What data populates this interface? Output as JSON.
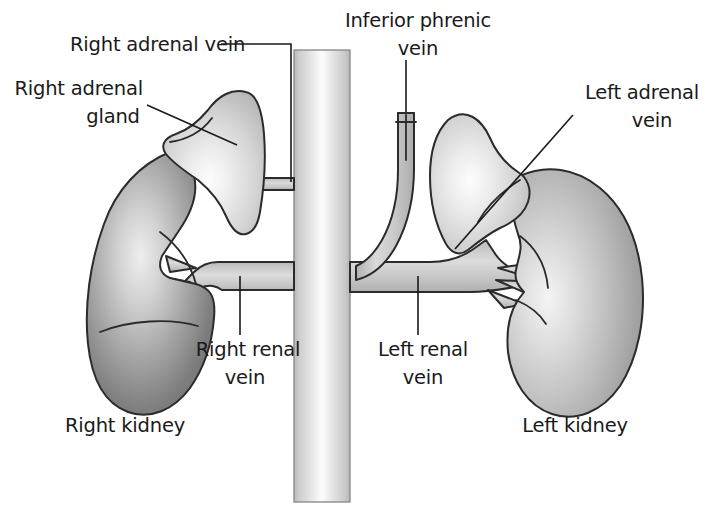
{
  "figure": {
    "background_color": "#ffffff",
    "outline_color": "#2b2b2b",
    "text_color": "#1a1a1a",
    "width": 715,
    "height": 528
  },
  "labels": {
    "right_adrenal_vein": "Right adrenal vein",
    "right_adrenal_gland_line1": "Right adrenal",
    "right_adrenal_gland_line2": "gland",
    "inferior_phrenic_vein_line1": "Inferior phrenic",
    "inferior_phrenic_vein_line2": "vein",
    "left_adrenal_vein_line1": "Left adrenal",
    "left_adrenal_vein_line2": "vein",
    "right_renal_vein_line1": "Right renal",
    "right_renal_vein_line2": "vein",
    "left_renal_vein_line1": "Left renal",
    "left_renal_vein_line2": "vein",
    "right_kidney": "Right kidney",
    "left_kidney": "Left kidney"
  },
  "structures": [
    {
      "name": "inferior-vena-cava",
      "kind": "vessel",
      "shading": "vertical-cylinder-gradient"
    },
    {
      "name": "right-kidney",
      "kind": "organ",
      "shading": "dark-radial-gradient"
    },
    {
      "name": "left-kidney",
      "kind": "organ",
      "shading": "mid-radial-gradient"
    },
    {
      "name": "right-adrenal-gland",
      "kind": "organ",
      "shading": "light-radial-gradient"
    },
    {
      "name": "left-adrenal-gland",
      "kind": "organ",
      "shading": "light-radial-gradient"
    },
    {
      "name": "right-adrenal-vein",
      "kind": "vessel",
      "shading": "flat-grey"
    },
    {
      "name": "left-adrenal-vein",
      "kind": "vessel",
      "shading": "flat-grey"
    },
    {
      "name": "right-renal-vein",
      "kind": "vessel",
      "shading": "flat-grey"
    },
    {
      "name": "left-renal-vein",
      "kind": "vessel",
      "shading": "flat-grey"
    },
    {
      "name": "inferior-phrenic-vein",
      "kind": "vessel",
      "shading": "cut-tube-grey"
    }
  ],
  "palette": {
    "ivc_light": "#fbfbfb",
    "ivc_mid": "#d2d2d2",
    "ivc_edge": "#b4b4b4",
    "vessel_fill": "#c7c7c7",
    "kidney_dark_edge": "#6e6e6e",
    "kidney_dark_center": "#e8e8e8",
    "kidney_light_edge": "#9a9a9a",
    "kidney_light_center": "#f2f2f2",
    "adrenal_edge": "#b8b8b8",
    "adrenal_center": "#fafafa",
    "outline": "#2b2b2b",
    "text": "#1a1a1a"
  }
}
